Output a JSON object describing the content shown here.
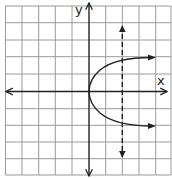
{
  "diagram": {
    "type": "coordinate-graph",
    "grid": {
      "columns": 10,
      "rows": 10,
      "color": "#9a9a9a"
    },
    "axes": {
      "x_label": "x",
      "y_label": "y",
      "color": "#222222"
    },
    "curve": {
      "kind": "parabola opening right",
      "vertex": [
        0,
        0
      ],
      "color": "#222222"
    },
    "dashed_line": {
      "kind": "vertical line",
      "x": 2,
      "color": "#222222"
    }
  }
}
